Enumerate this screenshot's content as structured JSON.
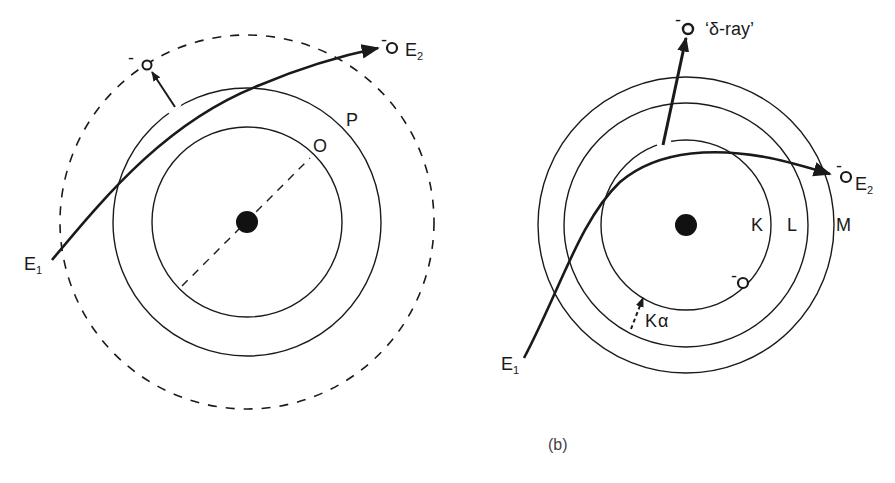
{
  "figure": {
    "caption": "(b)",
    "stroke_color": "#1a1a1a"
  },
  "left_diagram": {
    "nucleus": {
      "cx": 247,
      "cy": 222,
      "r": 11
    },
    "shells": [
      {
        "label": "O",
        "r": 95,
        "style": "solid"
      },
      {
        "label": "P",
        "r": 134,
        "style": "solid"
      },
      {
        "label": "",
        "r": 187,
        "style": "dashed"
      }
    ],
    "incident_label": "E",
    "incident_sub": "1",
    "outgoing_label": "E",
    "outgoing_sub": "2",
    "electron_charge": "-",
    "ejected_charge": "-"
  },
  "right_diagram": {
    "nucleus": {
      "cx": 686,
      "cy": 225,
      "r": 11
    },
    "shells": [
      {
        "label": "K",
        "r": 85,
        "style": "solid"
      },
      {
        "label": "L",
        "r": 122,
        "style": "solid"
      },
      {
        "label": "M",
        "r": 148,
        "style": "solid"
      }
    ],
    "incident_label": "E",
    "incident_sub": "1",
    "outgoing_label": "E",
    "outgoing_sub": "2",
    "delta_ray_label": "‘δ-ray’",
    "k_alpha_label": "K",
    "k_alpha_sub": "α",
    "electron_charge": "-"
  }
}
